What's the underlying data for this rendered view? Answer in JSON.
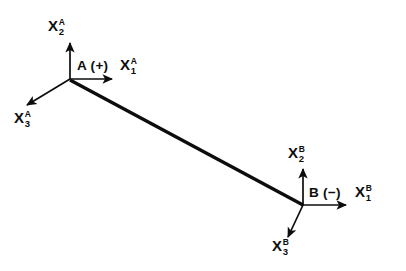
{
  "figure": {
    "background_color": "#ffffff",
    "stroke_color": "#0d0d0d",
    "width": 406,
    "height": 271
  },
  "frames": [
    {
      "id": "A",
      "origin_label": "A (+)",
      "polarity": "+",
      "origin": {
        "x": 70,
        "y": 79
      },
      "axes": [
        {
          "name": "x2-a",
          "base": "X",
          "subscript": "2",
          "superscript": "A",
          "tip": {
            "x": 70,
            "y": 41
          },
          "label_pos": {
            "x": 48,
            "y": 18
          }
        },
        {
          "name": "x1-a",
          "base": "X",
          "subscript": "1",
          "superscript": "A",
          "tip": {
            "x": 116,
            "y": 79
          },
          "label_pos": {
            "x": 120,
            "y": 57
          }
        },
        {
          "name": "x3-a",
          "base": "X",
          "subscript": "3",
          "superscript": "A",
          "tip": {
            "x": 24,
            "y": 107
          },
          "label_pos": {
            "x": 14,
            "y": 110
          }
        }
      ]
    },
    {
      "id": "B",
      "origin_label": "B (−)",
      "polarity": "−",
      "origin": {
        "x": 303,
        "y": 205
      },
      "axes": [
        {
          "name": "x2-b",
          "base": "X",
          "subscript": "2",
          "superscript": "B",
          "tip": {
            "x": 303,
            "y": 167
          },
          "label_pos": {
            "x": 288,
            "y": 145
          }
        },
        {
          "name": "x1-b",
          "base": "X",
          "subscript": "1",
          "superscript": "B",
          "tip": {
            "x": 350,
            "y": 205
          },
          "label_pos": {
            "x": 355,
            "y": 184
          }
        },
        {
          "name": "x3-b",
          "base": "X",
          "subscript": "3",
          "superscript": "B",
          "tip": {
            "x": 285,
            "y": 239
          },
          "label_pos": {
            "x": 272,
            "y": 238
          }
        }
      ]
    }
  ],
  "connector": {
    "name": "vector-a-to-b",
    "from": {
      "x": 70,
      "y": 80
    },
    "to": {
      "x": 303,
      "y": 205
    },
    "arrow_at": {
      "x": 163,
      "y": 130
    },
    "direction": "A-to-B"
  }
}
